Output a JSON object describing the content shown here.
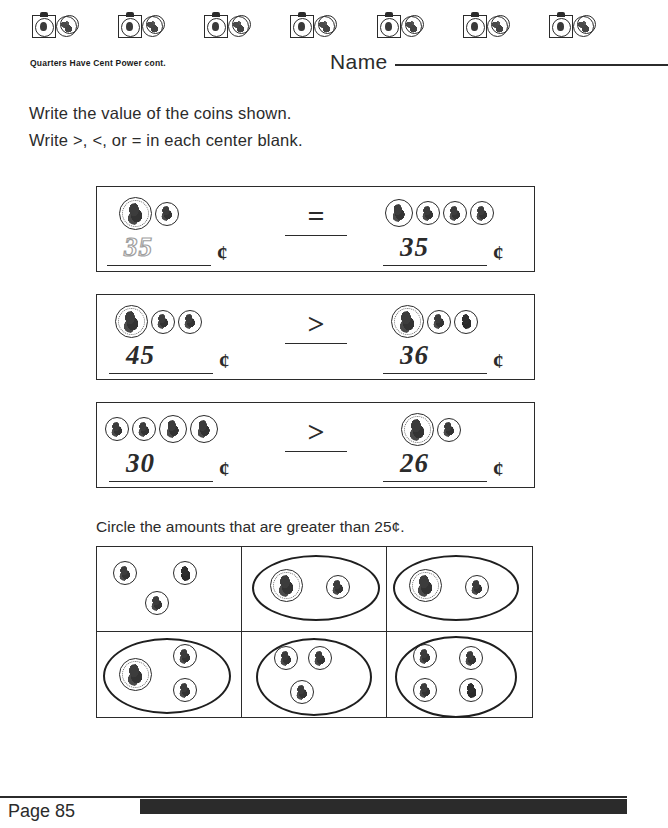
{
  "header": {
    "motif_count": 7,
    "motif_icon": "quarter-and-dime-motif",
    "sheet_title": "Quarters Have Cent Power cont.",
    "name_label": "Name"
  },
  "instructions": {
    "line1": "Write the value of the coins shown.",
    "line2": "Write >, <, or = in each center blank."
  },
  "comparisons": [
    {
      "left": {
        "coins": [
          "quarter",
          "dime"
        ],
        "answer": "35",
        "answer_style": "traced",
        "unit": "¢"
      },
      "operator": "=",
      "right": {
        "coins": [
          "nickel",
          "dime",
          "dime",
          "dime"
        ],
        "answer": "35",
        "answer_style": "handwritten",
        "unit": "¢"
      }
    },
    {
      "left": {
        "coins": [
          "quarter",
          "dime",
          "dime"
        ],
        "answer": "45",
        "answer_style": "handwritten",
        "unit": "¢"
      },
      "operator": ">",
      "right": {
        "coins": [
          "quarter",
          "dime",
          "penny"
        ],
        "answer": "36",
        "answer_style": "handwritten",
        "unit": "¢"
      }
    },
    {
      "left": {
        "coins": [
          "dime",
          "dime",
          "nickel",
          "nickel"
        ],
        "answer": "30",
        "answer_style": "handwritten",
        "unit": "¢"
      },
      "operator": ">",
      "right": {
        "coins": [
          "quarter",
          "penny"
        ],
        "answer": "26",
        "answer_style": "handwritten",
        "unit": "¢"
      }
    }
  ],
  "circle_section": {
    "instruction": "Circle the amounts that are greater than 25¢.",
    "cells": [
      {
        "coins": [
          "dime",
          "penny",
          "dime"
        ],
        "circled": false
      },
      {
        "coins": [
          "quarter",
          "dime"
        ],
        "circled": true
      },
      {
        "coins": [
          "quarter",
          "dime"
        ],
        "circled": true
      },
      {
        "coins": [
          "quarter",
          "dime",
          "dime"
        ],
        "circled": true
      },
      {
        "coins": [
          "dime",
          "dime",
          "dime"
        ],
        "circled": true
      },
      {
        "coins": [
          "dime",
          "dime",
          "dime",
          "penny"
        ],
        "circled": true
      }
    ]
  },
  "footer": {
    "page_label": "Page 85"
  }
}
